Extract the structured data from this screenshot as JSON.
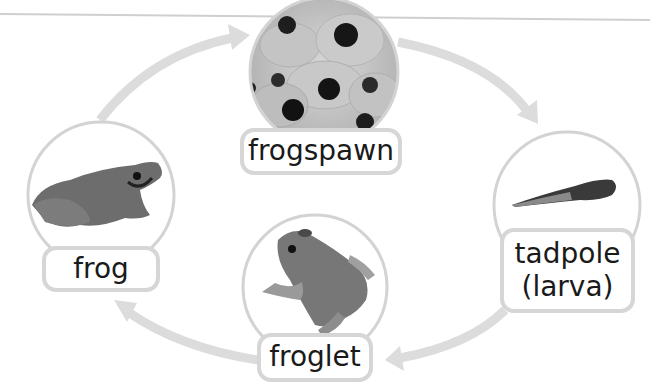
{
  "diagram": {
    "type": "life-cycle",
    "subject": "frog",
    "direction": "clockwise",
    "colors": {
      "arrow": "#dcdcdc",
      "circle_outline": "#d3d3d3",
      "label_border": "#d6d6d6",
      "text": "#1a1a1a",
      "top_rule": "#cfcfcf"
    },
    "stages": [
      {
        "id": "frogspawn",
        "label": "frogspawn",
        "image": "frogspawn-photo"
      },
      {
        "id": "tadpole",
        "label_line1": "tadpole",
        "label_line2": "(larva)",
        "image": "tadpole-photo"
      },
      {
        "id": "froglet",
        "label": "froglet",
        "image": "froglet-photo"
      },
      {
        "id": "frog",
        "label": "frog",
        "image": "frog-photo"
      }
    ],
    "arrows": [
      {
        "from": "frog",
        "to": "frogspawn"
      },
      {
        "from": "frogspawn",
        "to": "tadpole"
      },
      {
        "from": "tadpole",
        "to": "froglet"
      },
      {
        "from": "froglet",
        "to": "frog"
      }
    ]
  }
}
